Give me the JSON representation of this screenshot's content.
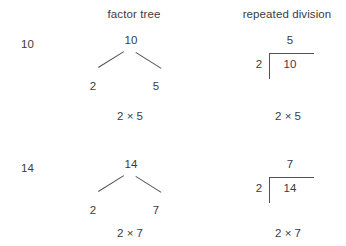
{
  "page": {
    "background_color": "#ffffff",
    "text_color": "#3b3b44",
    "rule_color": "#51515a"
  },
  "headers": {
    "row_label_column": "",
    "factor_tree": "factor tree",
    "repeated_division": "repeated division"
  },
  "rows": [
    {
      "label": "10",
      "factor_tree": {
        "root": "10",
        "left_leaf": "2",
        "right_leaf": "5",
        "result": "2 × 5"
      },
      "repeated_division": {
        "quotient": "5",
        "divisor": "2",
        "dividend": "10",
        "result": "2 × 5"
      }
    },
    {
      "label": "14",
      "factor_tree": {
        "root": "14",
        "left_leaf": "2",
        "right_leaf": "7",
        "result": "2 × 7"
      },
      "repeated_division": {
        "quotient": "7",
        "divisor": "2",
        "dividend": "14",
        "result": "2 × 7"
      }
    }
  ]
}
